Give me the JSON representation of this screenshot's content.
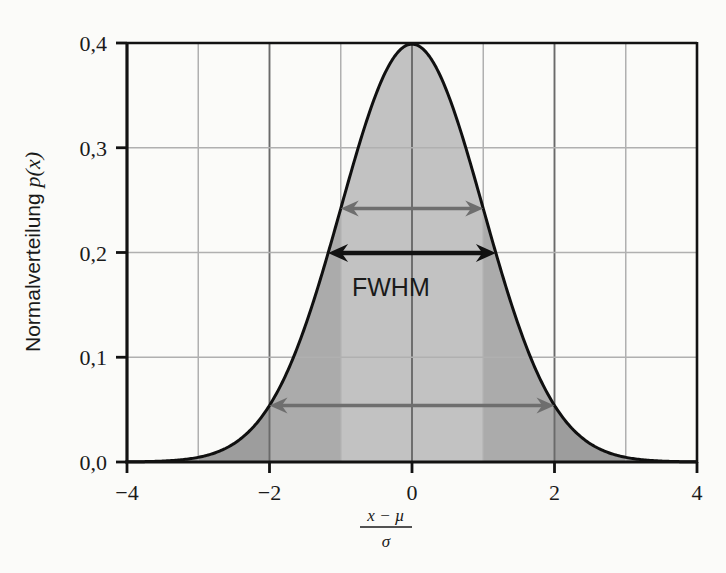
{
  "chart_data": {
    "type": "area",
    "title": "",
    "subtitle": "",
    "xlabel": "(x - µ) / σ",
    "xlabel_parts": {
      "numerator": "x − µ",
      "denominator": "σ"
    },
    "ylabel": "Normalverteilung p(x)",
    "ylabel_parts": {
      "text": "Normalverteilung",
      "symbol": "p(x)"
    },
    "xlim": [
      -4,
      4
    ],
    "ylim": [
      0.0,
      0.4
    ],
    "grid": true,
    "legend": "none",
    "x_ticks": [
      -4,
      -2,
      0,
      2,
      4
    ],
    "x_tick_labels": [
      "−4",
      "−2",
      "0",
      "2",
      "4"
    ],
    "x_gridlines": [
      -4,
      -3,
      -2,
      -1,
      0,
      1,
      2,
      3,
      4
    ],
    "y_ticks": [
      0.0,
      0.1,
      0.2,
      0.3,
      0.4
    ],
    "y_tick_labels": [
      "0,0",
      "0,1",
      "0,2",
      "0,3",
      "0,4"
    ],
    "series": [
      {
        "name": "Normalverteilung p(x)",
        "formula": "standard normal pdf",
        "peak_value": 0.3989,
        "peak_x": 0,
        "fill_color": "#b6b6b6",
        "line_color": "#101010",
        "x": [
          -4,
          -3.5,
          -3,
          -2.5,
          -2,
          -1.5,
          -1,
          -0.5,
          0,
          0.5,
          1,
          1.5,
          2,
          2.5,
          3,
          3.5,
          4
        ],
        "values": [
          0.0001,
          0.0009,
          0.0044,
          0.0175,
          0.054,
          0.1295,
          0.242,
          0.3521,
          0.3989,
          0.3521,
          0.242,
          0.1295,
          0.054,
          0.0175,
          0.0044,
          0.0009,
          0.0001
        ]
      }
    ],
    "shaded_bands": [
      {
        "name": "outer-left",
        "from": -4,
        "to": -2,
        "color": "#9d9d9d"
      },
      {
        "name": "sigma2-left",
        "from": -2,
        "to": -1,
        "color": "#ababab"
      },
      {
        "name": "sigma1-center",
        "from": -1,
        "to": 1,
        "color": "#c2c2c2"
      },
      {
        "name": "sigma2-right",
        "from": 1,
        "to": 2,
        "color": "#ababab"
      },
      {
        "name": "outer-right",
        "from": 2,
        "to": 4,
        "color": "#9d9d9d"
      }
    ],
    "annotations": [
      {
        "name": "sigma-1-arrow",
        "type": "double-arrow",
        "label": "",
        "x_from": -1,
        "x_to": 1,
        "y": 0.242,
        "color": "#6e6e6e"
      },
      {
        "name": "fwhm-arrow",
        "type": "double-arrow",
        "label": "FWHM",
        "x_from": -1.1774,
        "x_to": 1.1774,
        "y": 0.1995,
        "color": "#111111"
      },
      {
        "name": "sigma-2-arrow",
        "type": "double-arrow",
        "label": "",
        "x_from": -2,
        "x_to": 2,
        "y": 0.054,
        "color": "#6e6e6e"
      }
    ],
    "annotation_labels": {
      "fwhm": "FWHM"
    },
    "colors": {
      "axis": "#121212",
      "grid_major": "#6a6a6a",
      "grid_minor": "#b0b0b0",
      "curve": "#101010",
      "fill": "#b8b8b8",
      "arrow_gray": "#6e6e6e",
      "arrow_black": "#111111",
      "background": "#fbfbf9"
    }
  }
}
